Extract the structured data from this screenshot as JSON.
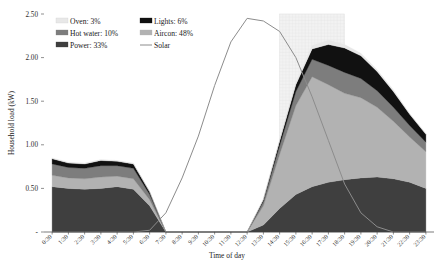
{
  "chart_data": {
    "type": "area",
    "title": "",
    "xlabel": "Time of day",
    "ylabel": "Household load (kW)",
    "stacked": true,
    "ylim": [
      0,
      2.5
    ],
    "yticks": [
      "-",
      "0.50",
      "1.00",
      "1.50",
      "2.00",
      "2.50"
    ],
    "ytick_values": [
      0,
      0.5,
      1.0,
      1.5,
      2.0,
      2.5
    ],
    "grid": false,
    "legend_position": "top-left-inside",
    "categories": [
      "0:30",
      "1:30",
      "2:30",
      "3:30",
      "4:30",
      "5:30",
      "6:30",
      "7:30",
      "8:30",
      "9:30",
      "10:30",
      "11:30",
      "12:30",
      "13:30",
      "14:30",
      "15:30",
      "16:30",
      "17:30",
      "18:30",
      "19:30",
      "20:30",
      "21:30",
      "22:30",
      "23:30"
    ],
    "series": [
      {
        "name": "Power",
        "label": "Power: 33%",
        "share_pct": 33,
        "color": "#3f3f3f",
        "order": 1,
        "values": [
          0.52,
          0.5,
          0.49,
          0.5,
          0.52,
          0.49,
          0.3,
          0.0,
          0.0,
          0.0,
          0.0,
          0.0,
          0.0,
          0.08,
          0.27,
          0.43,
          0.52,
          0.57,
          0.6,
          0.62,
          0.63,
          0.61,
          0.57,
          0.5
        ]
      },
      {
        "name": "Aircon",
        "label": "Aircon: 48%",
        "share_pct": 48,
        "color": "#b2b2b2",
        "order": 2,
        "values": [
          0.13,
          0.12,
          0.12,
          0.13,
          0.12,
          0.12,
          0.07,
          0.0,
          0.0,
          0.0,
          0.0,
          0.0,
          0.0,
          0.22,
          0.62,
          1.02,
          1.26,
          1.12,
          0.99,
          0.92,
          0.8,
          0.66,
          0.52,
          0.42
        ]
      },
      {
        "name": "Hot water",
        "label": "Hot water: 10%",
        "share_pct": 10,
        "color": "#7d7d7d",
        "order": 3,
        "values": [
          0.13,
          0.12,
          0.12,
          0.13,
          0.12,
          0.12,
          0.06,
          0.0,
          0.0,
          0.0,
          0.0,
          0.0,
          0.0,
          0.05,
          0.1,
          0.16,
          0.2,
          0.22,
          0.24,
          0.22,
          0.19,
          0.16,
          0.13,
          0.11
        ]
      },
      {
        "name": "Lights",
        "label": "Lights: 6%",
        "share_pct": 6,
        "color": "#111111",
        "order": 4,
        "values": [
          0.06,
          0.05,
          0.05,
          0.06,
          0.05,
          0.05,
          0.03,
          0.0,
          0.0,
          0.0,
          0.0,
          0.0,
          0.0,
          0.02,
          0.05,
          0.08,
          0.12,
          0.24,
          0.28,
          0.26,
          0.22,
          0.18,
          0.13,
          0.09
        ]
      },
      {
        "name": "Oven",
        "label": "Oven: 3%",
        "share_pct": 3,
        "color": "#e8e8e8",
        "order": 5,
        "values": [
          0.01,
          0.01,
          0.01,
          0.01,
          0.01,
          0.01,
          0.0,
          0.0,
          0.0,
          0.0,
          0.0,
          0.0,
          0.0,
          0.01,
          0.02,
          0.03,
          0.04,
          0.05,
          0.04,
          0.03,
          0.02,
          0.02,
          0.01,
          0.01
        ]
      }
    ],
    "line_series": [
      {
        "name": "Solar",
        "label": "Solar",
        "color": "#8c8c8c",
        "values": [
          0.0,
          0.0,
          0.0,
          0.0,
          0.0,
          0.0,
          0.02,
          0.22,
          0.62,
          1.1,
          1.68,
          2.18,
          2.45,
          2.42,
          2.3,
          2.0,
          1.55,
          1.05,
          0.55,
          0.22,
          0.06,
          0.0,
          0.0,
          0.0
        ]
      }
    ],
    "shaded_band": {
      "from": "15:00",
      "to": "18:30",
      "fill": "#f2f2f2"
    },
    "legend": [
      {
        "label": "Oven: 3%",
        "color": "#e8e8e8",
        "type": "swatch"
      },
      {
        "label": "Lights: 6%",
        "color": "#111111",
        "type": "swatch"
      },
      {
        "label": "Hot water: 10%",
        "color": "#7d7d7d",
        "type": "swatch"
      },
      {
        "label": "Aircon: 48%",
        "color": "#b2b2b2",
        "type": "swatch"
      },
      {
        "label": "Power: 33%",
        "color": "#3f3f3f",
        "type": "swatch"
      },
      {
        "label": "Solar",
        "color": "#8c8c8c",
        "type": "line"
      }
    ]
  }
}
